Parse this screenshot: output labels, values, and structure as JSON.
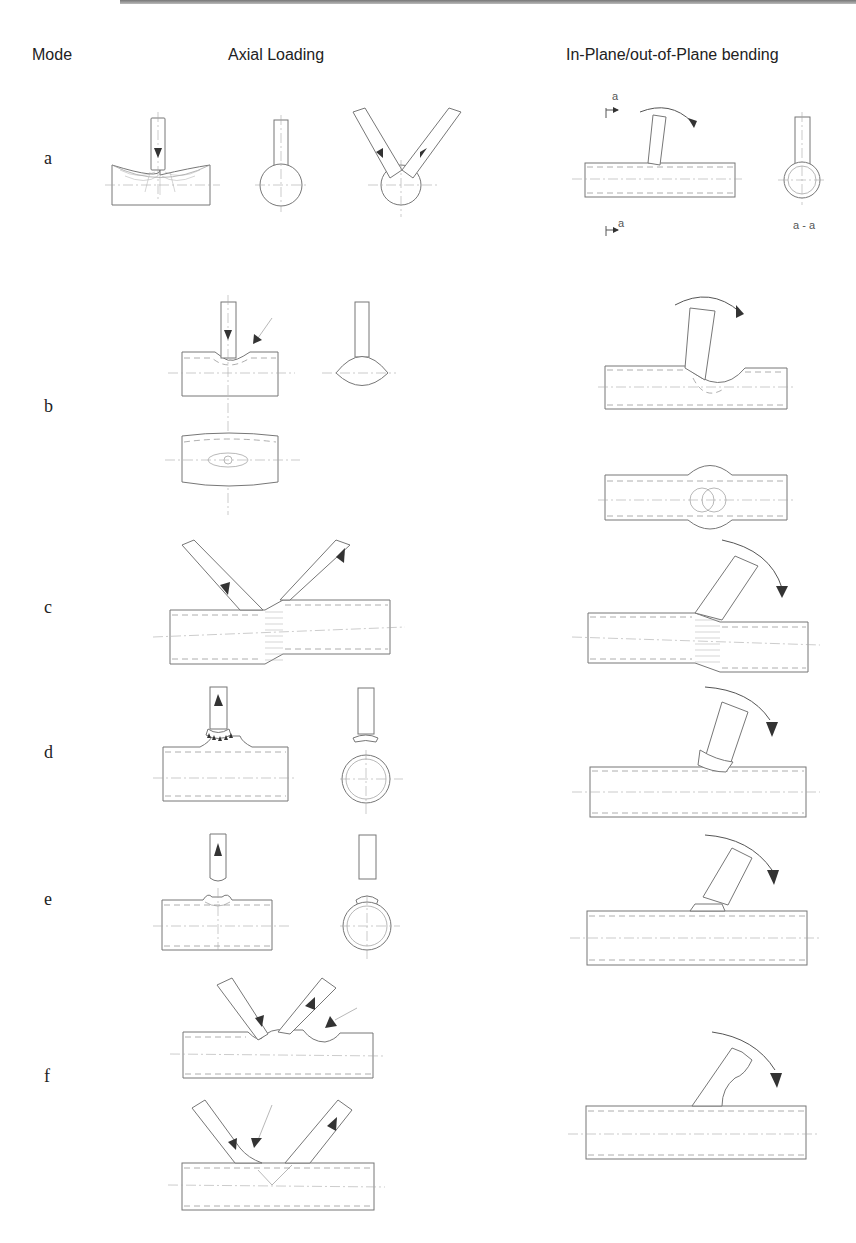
{
  "headers": {
    "mode": "Mode",
    "axial": "Axial Loading",
    "bending": "In-Plane/out-of-Plane bending"
  },
  "modes": [
    {
      "label": "a"
    },
    {
      "label": "b"
    },
    {
      "label": "c"
    },
    {
      "label": "d"
    },
    {
      "label": "e"
    },
    {
      "label": "f"
    }
  ],
  "section_labels": {
    "top": "a",
    "bottom": "a",
    "view": "a - a"
  }
}
